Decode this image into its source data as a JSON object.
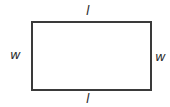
{
  "diagram": {
    "shape": "rectangle",
    "stroke_color": "#3a3a3a",
    "labels": {
      "top": "l",
      "bottom": "l",
      "left": "w",
      "right": "w"
    }
  }
}
